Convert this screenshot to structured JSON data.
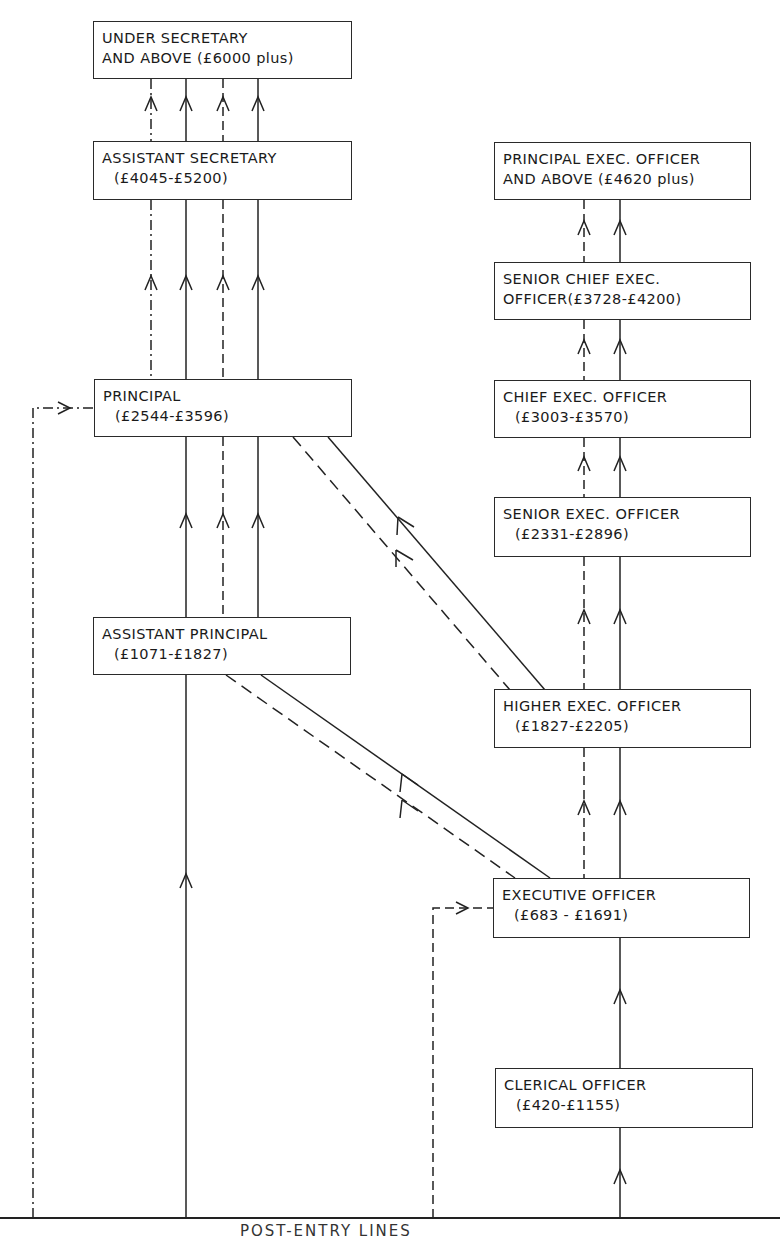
{
  "legend": {
    "solid": "promotion line",
    "dashed": "promotion line (alternate route)",
    "dash_dot": "direct entry line"
  },
  "administrative_class": [
    {
      "id": "under_sec",
      "line1": "UNDER SECRETARY",
      "line2": "AND ABOVE (£6000 plus)"
    },
    {
      "id": "asst_sec",
      "line1": "ASSISTANT SECRETARY",
      "line2": "(£4045-£5200)"
    },
    {
      "id": "principal",
      "line1": "PRINCIPAL",
      "line2": "(£2544-£3596)"
    },
    {
      "id": "asst_principal",
      "line1": "ASSISTANT PRINCIPAL",
      "line2": "(£1071-£1827)"
    }
  ],
  "executive_class": [
    {
      "id": "peo",
      "line1": "PRINCIPAL EXEC. OFFICER",
      "line2": "AND ABOVE (£4620 plus)"
    },
    {
      "id": "sceo",
      "line1": "SENIOR CHIEF EXEC.",
      "line2": "OFFICER(£3728-£4200)"
    },
    {
      "id": "ceo",
      "line1": "CHIEF EXEC. OFFICER",
      "line2": "(£3003-£3570)"
    },
    {
      "id": "seo",
      "line1": "SENIOR EXEC. OFFICER",
      "line2": "(£2331-£2896)"
    },
    {
      "id": "heo",
      "line1": "HIGHER EXEC. OFFICER",
      "line2": "(£1827-£2205)"
    },
    {
      "id": "eo",
      "line1": "EXECUTIVE OFFICER",
      "line2": "(£683 - £1691)"
    },
    {
      "id": "co",
      "line1": "CLERICAL OFFICER",
      "line2": "(£420-£1155)"
    }
  ],
  "footer": {
    "label": "POST-ENTRY LINES"
  }
}
